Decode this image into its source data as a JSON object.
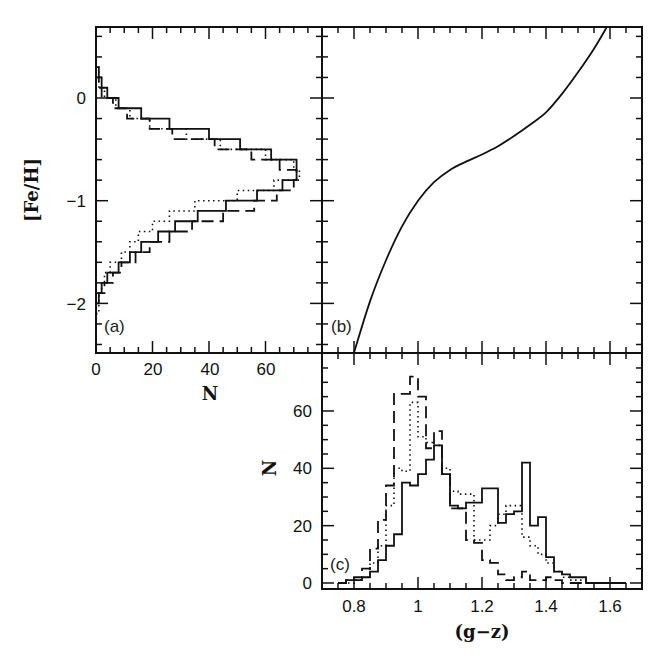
{
  "chart_data": [
    {
      "panel": "a",
      "panel_label": "(a)",
      "type": "histogram",
      "orientation": "horizontal",
      "xlabel": "N",
      "ylabel": "[Fe/H]",
      "xlim": [
        0,
        80
      ],
      "ylim": [
        -2.48,
        0.69
      ],
      "xticks": [
        0,
        20,
        40,
        60
      ],
      "xtick_labels": [
        "0",
        "20",
        "40",
        "60"
      ],
      "yticks": [
        0,
        -1,
        -2
      ],
      "ytick_labels": [
        "0",
        "−1",
        "−2"
      ],
      "bin_width": 0.1,
      "bin_edges_start": -2.1,
      "series": [
        {
          "name": "solid",
          "style": "solid",
          "values": [
            0,
            1,
            2,
            4,
            8,
            12,
            16,
            22,
            28,
            36,
            46,
            57,
            66,
            71,
            71,
            62,
            51,
            40,
            26,
            16,
            8,
            4,
            2,
            1,
            0
          ]
        },
        {
          "name": "dotted",
          "style": "dotted",
          "values": [
            1,
            1,
            2,
            3,
            5,
            9,
            12,
            15,
            20,
            26,
            35,
            50,
            63,
            72,
            70,
            60,
            44,
            32,
            19,
            12,
            7,
            3,
            1,
            1,
            0
          ]
        },
        {
          "name": "dashed",
          "style": "dashed",
          "values": [
            0,
            0,
            3,
            6,
            9,
            14,
            19,
            26,
            34,
            45,
            56,
            64,
            70,
            71,
            65,
            55,
            42,
            27,
            19,
            11,
            6,
            2,
            1,
            0,
            0
          ]
        }
      ]
    },
    {
      "panel": "b",
      "panel_label": "(b)",
      "type": "line",
      "xlabel": "(g−z)",
      "ylabel": "[Fe/H]",
      "xlim": [
        0.7,
        1.7
      ],
      "ylim": [
        -2.48,
        0.69
      ],
      "series": [
        {
          "name": "color-metallicity relation",
          "style": "solid",
          "x": [
            0.8,
            0.85,
            0.9,
            0.95,
            1.0,
            1.05,
            1.1,
            1.15,
            1.2,
            1.25,
            1.3,
            1.35,
            1.4,
            1.45,
            1.5,
            1.55,
            1.59
          ],
          "y": [
            -2.48,
            -1.98,
            -1.58,
            -1.25,
            -1.0,
            -0.82,
            -0.7,
            -0.62,
            -0.55,
            -0.47,
            -0.37,
            -0.26,
            -0.14,
            0.04,
            0.25,
            0.48,
            0.69
          ]
        }
      ]
    },
    {
      "panel": "c",
      "panel_label": "(c)",
      "type": "histogram",
      "xlabel": "(g−z)",
      "ylabel": "N",
      "xlim": [
        0.7,
        1.7
      ],
      "ylim": [
        0,
        80
      ],
      "xticks": [
        0.8,
        1.0,
        1.2,
        1.4,
        1.6
      ],
      "xtick_labels": [
        "0.8",
        "1",
        "1.2",
        "1.4",
        "1.6"
      ],
      "yticks": [
        0,
        20,
        40,
        60
      ],
      "ytick_labels": [
        "0",
        "20",
        "40",
        "60"
      ],
      "bin_width": 0.025,
      "bin_edges_start": 0.75,
      "series": [
        {
          "name": "solid",
          "style": "solid",
          "values": [
            0,
            1,
            1,
            2,
            4,
            8,
            13,
            17,
            35,
            34,
            38,
            43,
            48,
            38,
            27,
            26,
            28,
            28,
            33,
            33,
            21,
            24,
            25,
            42,
            20,
            23,
            9,
            4,
            3,
            2,
            2,
            0,
            0,
            0,
            0,
            0
          ]
        },
        {
          "name": "dotted",
          "style": "dotted",
          "values": [
            0,
            0,
            1,
            2,
            7,
            13,
            27,
            40,
            39,
            63,
            51,
            49,
            48,
            40,
            32,
            31,
            31,
            15,
            15,
            20,
            24,
            27,
            27,
            16,
            13,
            10,
            7,
            4,
            2,
            1,
            1,
            0,
            0,
            0,
            0,
            0
          ]
        },
        {
          "name": "dashed",
          "style": "dashed",
          "values": [
            0,
            1,
            2,
            5,
            12,
            22,
            34,
            66,
            66,
            72,
            65,
            47,
            53,
            38,
            26,
            26,
            15,
            14,
            8,
            7,
            3,
            1,
            2,
            4,
            1,
            1,
            2,
            1,
            0,
            0,
            0,
            0,
            0,
            0,
            0,
            0
          ]
        }
      ]
    }
  ]
}
